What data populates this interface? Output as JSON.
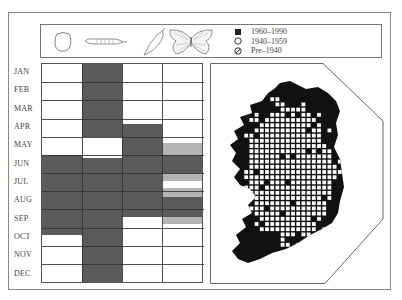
{
  "figure": {
    "type": "phenology chart and distribution map",
    "stages": [
      {
        "name": "egg",
        "icon": "egg-icon"
      },
      {
        "name": "larva",
        "icon": "caterpillar-icon"
      },
      {
        "name": "pupa",
        "icon": "chrysalis-icon"
      },
      {
        "name": "adult",
        "icon": "butterfly-icon"
      }
    ],
    "legend": [
      {
        "symbol": "filled-square",
        "label": "1960–1990"
      },
      {
        "symbol": "open-circle",
        "label": "1940–1959"
      },
      {
        "symbol": "slashed-circle",
        "label": "Pre–1940"
      }
    ],
    "months": [
      "JAN",
      "FEB",
      "MAR",
      "APR",
      "MAY",
      "JUN",
      "JUL",
      "AUG",
      "SEP",
      "OCT",
      "NOV",
      "DEC"
    ],
    "colors": {
      "dark": "#5a5a5a",
      "grey": "#b4b4b4",
      "white": "#ffffff",
      "map_black": "#111111"
    }
  },
  "chart_data": {
    "type": "table",
    "categories": [
      "JAN",
      "FEB",
      "MAR",
      "APR",
      "MAY",
      "JUN",
      "JUL",
      "AUG",
      "SEP",
      "OCT",
      "NOV",
      "DEC"
    ],
    "note": "Bands expressed as [start_month_fraction, end_month_fraction, shade]; months indexed 0=JAN .. 12=end DEC",
    "series": [
      {
        "name": "egg",
        "bands": [
          [
            5.0,
            9.4,
            "dark"
          ]
        ]
      },
      {
        "name": "larva",
        "bands": [
          [
            0.0,
            4.0,
            "dark"
          ],
          [
            5.15,
            12.0,
            "dark"
          ]
        ]
      },
      {
        "name": "pupa",
        "bands": [
          [
            3.3,
            8.4,
            "dark"
          ]
        ]
      },
      {
        "name": "adult",
        "bands": [
          [
            4.35,
            5.0,
            "grey"
          ],
          [
            5.0,
            6.0,
            "dark"
          ],
          [
            6.0,
            6.45,
            "grey"
          ],
          [
            6.85,
            7.3,
            "grey"
          ],
          [
            7.3,
            8.4,
            "dark"
          ],
          [
            8.4,
            8.8,
            "grey"
          ]
        ]
      }
    ]
  }
}
